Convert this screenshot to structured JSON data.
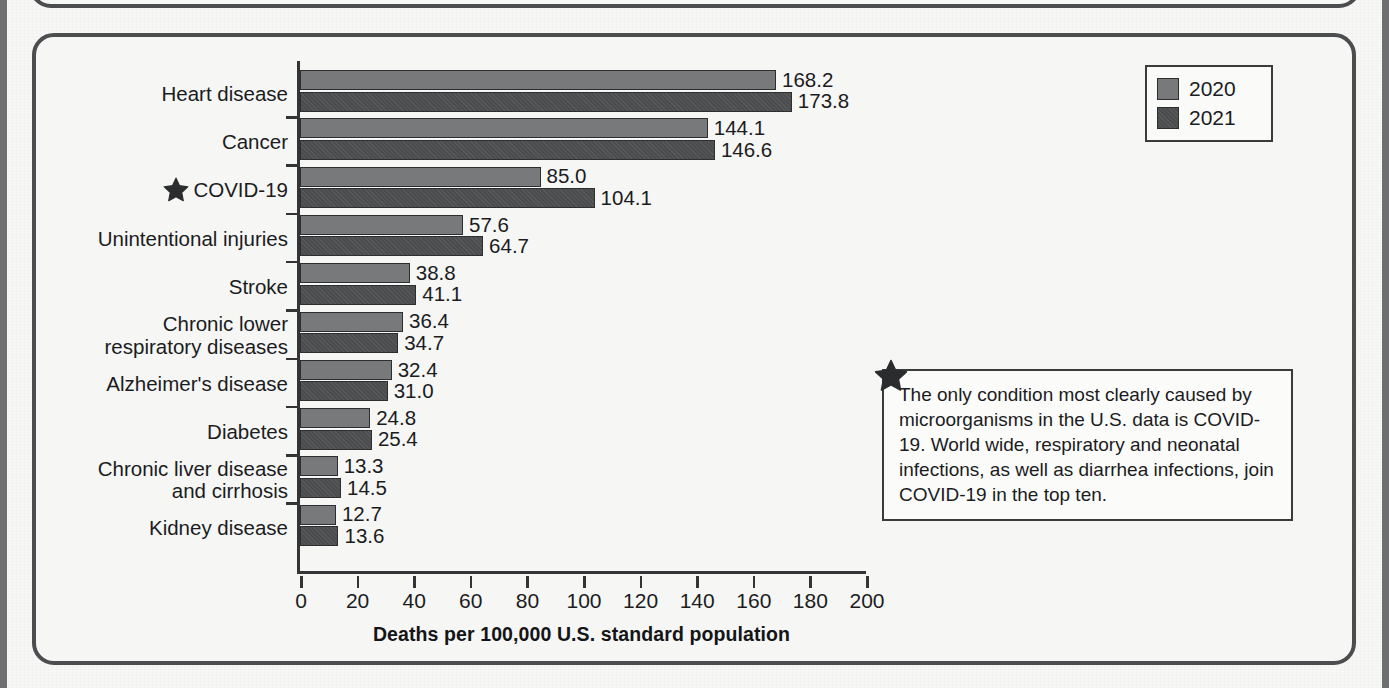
{
  "figure": {
    "axis_title": "Deaths per 100,000 U.S. standard population",
    "star_icon_name": "star-marker",
    "legend": {
      "entries": [
        {
          "label": "2020",
          "color": "#77797b"
        },
        {
          "label": "2021",
          "color": "#4a4c4e"
        }
      ]
    },
    "callout": {
      "text": "The only condition most clearly caused by microorganisms in the U.S. data is COVID-19. World wide, respiratory and neonatal infections, as well as diarrhea infections, join COVID-19 in the top ten."
    }
  },
  "chart_data": {
    "type": "bar",
    "orientation": "horizontal",
    "title": "",
    "subtitle": "",
    "xlabel": "Deaths per 100,000 U.S. standard population",
    "ylabel": "",
    "xlim": [
      0,
      200
    ],
    "xticks": [
      0,
      20,
      40,
      60,
      80,
      100,
      120,
      140,
      160,
      180,
      200
    ],
    "grid": false,
    "legend_position": "top-right",
    "categories": [
      "Heart disease",
      "Cancer",
      "COVID-19",
      "Unintentional injuries",
      "Stroke",
      "Chronic lower\nrespiratory diseases",
      "Alzheimer's disease",
      "Diabetes",
      "Chronic liver disease\nand cirrhosis",
      "Kidney disease"
    ],
    "category_starred": [
      false,
      false,
      true,
      false,
      false,
      false,
      false,
      false,
      false,
      false
    ],
    "series": [
      {
        "name": "2020",
        "color": "#77797b",
        "values": [
          168.2,
          144.1,
          85.0,
          57.6,
          38.8,
          36.4,
          32.4,
          24.8,
          13.3,
          12.7
        ]
      },
      {
        "name": "2021",
        "color": "#4a4c4e",
        "values": [
          173.8,
          146.6,
          104.1,
          64.7,
          41.1,
          34.7,
          31.0,
          25.4,
          14.5,
          13.6
        ]
      }
    ],
    "value_labels": [
      [
        "168.2",
        "173.8"
      ],
      [
        "144.1",
        "146.6"
      ],
      [
        "85.0",
        "104.1"
      ],
      [
        "57.6",
        "64.7"
      ],
      [
        "38.8",
        "41.1"
      ],
      [
        "36.4",
        "34.7"
      ],
      [
        "32.4",
        "31.0"
      ],
      [
        "24.8",
        "25.4"
      ],
      [
        "13.3",
        "14.5"
      ],
      [
        "12.7",
        "13.6"
      ]
    ]
  }
}
